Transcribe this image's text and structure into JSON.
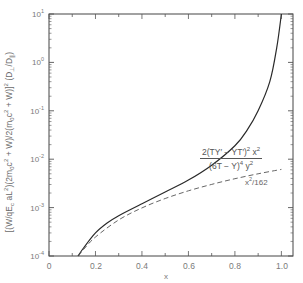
{
  "chart_data": {
    "type": "line",
    "title": "",
    "xlabel": "x",
    "ylabel": "[(W/qE_c aL^2)(2m_0c^2 + W)/2(m_0c^2 + W)]^2 (D_⊥/D_∥)",
    "xlim": [
      0,
      1.05
    ],
    "ylim": [
      0.0001,
      10
    ],
    "yscale": "log",
    "grid": false,
    "x_ticks": [
      "0",
      "0.2",
      "0.4",
      "0.6",
      "0.8",
      "1.0"
    ],
    "y_ticks": [
      "10^-4",
      "10^-3",
      "10^-2",
      "10^-1",
      "10^0",
      "10^1"
    ],
    "series": [
      {
        "name": "2(TY' - YT')^2 x^2 / (6T - Y)^4 y^2",
        "style": "solid",
        "x": [
          0.125,
          0.15,
          0.2,
          0.25,
          0.3,
          0.4,
          0.5,
          0.6,
          0.7,
          0.8,
          0.85,
          0.9,
          0.95,
          0.98,
          1.0
        ],
        "y": [
          0.0001,
          0.00015,
          0.0003,
          0.00048,
          0.00068,
          0.0012,
          0.0021,
          0.0037,
          0.0075,
          0.019,
          0.038,
          0.1,
          0.4,
          2.0,
          10
        ]
      },
      {
        "name": "x^2/162",
        "style": "dashed",
        "x": [
          0.127,
          0.15,
          0.2,
          0.3,
          0.4,
          0.5,
          0.6,
          0.7,
          0.8,
          0.9,
          1.0
        ],
        "y": [
          0.0001,
          0.000139,
          0.000247,
          0.000556,
          0.000988,
          0.00154,
          0.00222,
          0.00302,
          0.00395,
          0.005,
          0.00617
        ]
      }
    ],
    "annotations": [
      {
        "text": "2(TY' - YT')^2 x^2 / (6T - Y)^4 y^2",
        "target": "solid curve"
      },
      {
        "text": "x^2/162",
        "target": "dashed curve"
      }
    ]
  },
  "labels": {
    "ylabel": {
      "p1": "[(W/qE",
      "p1_sub": "c",
      "p2": " aL",
      "p2_sup": "2",
      "p3": ")(2m",
      "p3_sub": "0",
      "p4": "c",
      "p4_sup": "2",
      "p5": " + W)/2(m",
      "p5_sub": "0",
      "p6": "c",
      "p6_sup": "2",
      "p7": " + W)]",
      "p7_sup": "2",
      "p8": " (D",
      "p8_sub": "⊥",
      "p9": "/D",
      "p9_sub": "∥",
      "p10": ")"
    },
    "xlabel": "x",
    "y_ticks": [
      {
        "base": "10",
        "exp": "1"
      },
      {
        "base": "10",
        "exp": "0"
      },
      {
        "base": "10",
        "exp": "-1"
      },
      {
        "base": "10",
        "exp": "-2"
      },
      {
        "base": "10",
        "exp": "-3"
      },
      {
        "base": "10",
        "exp": "-4"
      }
    ],
    "x_ticks": [
      "0",
      "0.2",
      "0.4",
      "0.6",
      "0.8",
      "1.0"
    ],
    "anno_solid": {
      "num_a": "2(TY′ − YT′)",
      "num_sup1": "2",
      "num_b": " x",
      "num_sup2": "2",
      "den_a": "(6T − Y)",
      "den_sup1": "4",
      "den_b": " y",
      "den_sup2": "2"
    },
    "anno_dashed": {
      "a": "x",
      "sup": "2",
      "b": "/162"
    }
  }
}
